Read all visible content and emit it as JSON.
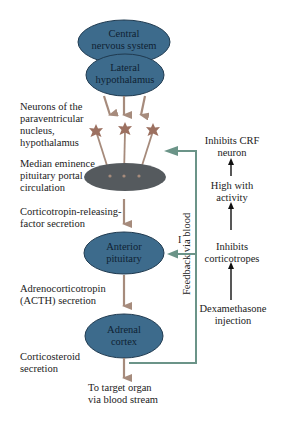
{
  "nodes": {
    "cns": {
      "line1": "Central",
      "line2": "nervous system"
    },
    "lateral_hypothalamus": {
      "line1": "Lateral",
      "line2": "hypothalamus"
    },
    "anterior_pituitary": {
      "line1": "Anterior",
      "line2": "pituitary"
    },
    "adrenal_cortex": {
      "line1": "Adrenal",
      "line2": "cortex"
    }
  },
  "left_labels": {
    "neurons": [
      "Neurons of the",
      "paraventricular",
      "nucleus,",
      "hypothalamus"
    ],
    "median_eminence": [
      "Median eminence",
      "pituitary portal",
      "circulation"
    ],
    "crf": [
      "Corticotropin-releasing-",
      "factor secretion"
    ],
    "acth": [
      "Adrenocorticotropin",
      "(ACTH) secretion"
    ],
    "corticosteroid": [
      "Corticosteroid",
      "secretion"
    ],
    "target": [
      "To target organ",
      "via blood stream"
    ]
  },
  "right_labels": {
    "inhibits_crf": [
      "Inhibits CRF",
      "neuron"
    ],
    "high_activity": [
      "High with",
      "activity"
    ],
    "inhibits_corticotropes": [
      "Inhibits",
      "corticotropes"
    ],
    "dexamethasone": [
      "Dexamethasone",
      "injection"
    ]
  },
  "feedback_label": "Feedback via blood",
  "inhibit_mark": "I",
  "colors": {
    "node_fill": "#3d6b8c",
    "node_stroke": "#1f3a50",
    "median_eminence_fill": "#555a5e",
    "arrow_tan": "#a68b7c",
    "feedback_green": "#6b9488",
    "neuron": "#9c7060"
  }
}
